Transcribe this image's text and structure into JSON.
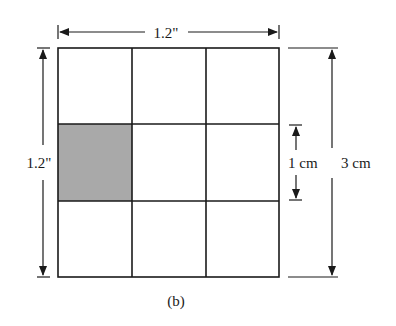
{
  "figure": {
    "caption": "(b)",
    "grid": {
      "rows": 3,
      "cols": 3,
      "shaded_cell": {
        "row": 1,
        "col": 0
      },
      "shade_color": "#a9a9a9",
      "line_color": "#1a1a1a"
    },
    "dimensions": {
      "top_width": "1.2\"",
      "left_height": "1.2\"",
      "cell_height": "1 cm",
      "total_height": "3 cm"
    }
  }
}
